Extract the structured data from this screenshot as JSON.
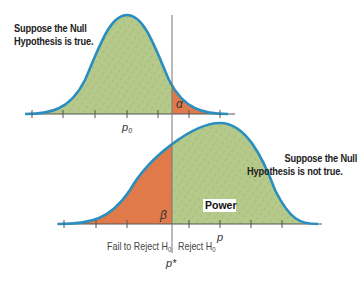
{
  "diagram": {
    "top_curve": {
      "caption_line1": "Suppose the Null",
      "caption_line2": "Hypothesis is true.",
      "mean_label": "p",
      "mean_subscript": "0",
      "tail_label": "α"
    },
    "bottom_curve": {
      "caption_line1": "Suppose the Null",
      "caption_line2": "Hypothesis is not true.",
      "mean_label": "p",
      "tail_label": "β",
      "power_label": "Power"
    },
    "regions": {
      "fail_label": "Fail to Reject H",
      "fail_subscript": "0",
      "reject_label": "Reject H",
      "reject_subscript": "0"
    },
    "cutoff_label": "p*",
    "colors": {
      "curve_stroke": "#2a8fbf",
      "fill_green": "#b5c98a",
      "fill_orange": "#e07a4a",
      "axis": "#555555"
    }
  }
}
